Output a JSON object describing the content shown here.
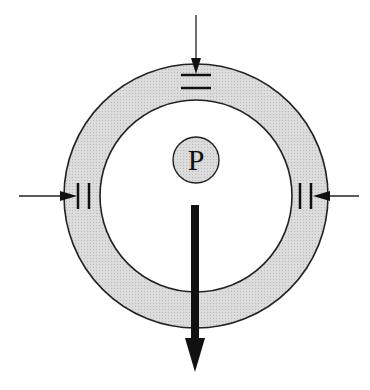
{
  "diagram": {
    "center_label": "P",
    "colors": {
      "ring_fill": "#d9d9d9",
      "stroke": "#222222",
      "background": "#ffffff"
    },
    "ring": {
      "cx": 196,
      "cy": 196,
      "outer_r": 132,
      "inner_r": 96
    },
    "center_circle": {
      "cx": 196,
      "cy": 160,
      "r": 23
    },
    "forces": [
      {
        "name": "top-arrow",
        "direction": "down"
      },
      {
        "name": "left-arrow",
        "direction": "right"
      },
      {
        "name": "right-arrow",
        "direction": "left"
      },
      {
        "name": "bottom-load-arrow",
        "direction": "down"
      }
    ]
  }
}
